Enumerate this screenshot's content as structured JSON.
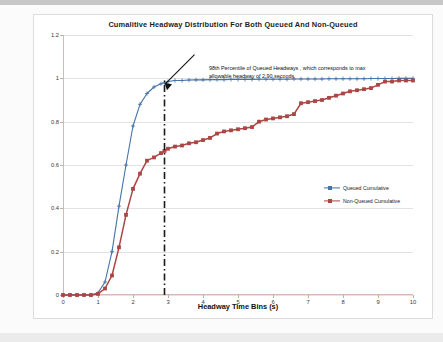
{
  "chart_data": {
    "type": "line",
    "title": "Cumalitive Headway Distribution For Both Queued And Non-Queued",
    "xlabel": "Headway Time Bins (s)",
    "ylabel": "Cumalitive Proportion",
    "xlim": [
      0,
      10
    ],
    "ylim": [
      0,
      1.2
    ],
    "xticks": [
      "0",
      "1",
      "2",
      "3",
      "4",
      "5",
      "6",
      "7",
      "8",
      "9",
      "10"
    ],
    "yticks": [
      "0",
      "0.2",
      "0.4",
      "0.6",
      "0.8",
      "1",
      "1.2"
    ],
    "grid": "horizontal",
    "legend_position": "right-middle",
    "annotations": [
      {
        "name": "percentile-callout",
        "text": "98th Percentile of Queued Headways , which corresponds to max allowable headway of 2.90 seconds",
        "target_x": 2.9,
        "target_y": 0.98
      },
      {
        "name": "threshold-line",
        "style": "dash-dot vertical",
        "x": 2.9,
        "color": "#1a1a1a"
      }
    ],
    "series": [
      {
        "name": "Queued Cumulative",
        "color": "#4572a7",
        "marker": "plus",
        "x": [
          0,
          0.2,
          0.4,
          0.6,
          0.8,
          1.0,
          1.2,
          1.4,
          1.6,
          1.8,
          2.0,
          2.2,
          2.4,
          2.6,
          2.8,
          2.9,
          3.0,
          3.2,
          3.4,
          3.6,
          3.8,
          4.0,
          4.2,
          4.4,
          4.6,
          4.8,
          5.0,
          5.2,
          5.4,
          5.6,
          5.8,
          6.0,
          6.2,
          6.4,
          6.6,
          6.8,
          7.0,
          7.2,
          7.4,
          7.6,
          7.8,
          8.0,
          8.2,
          8.4,
          8.6,
          8.8,
          9.0,
          9.2,
          9.4,
          9.6,
          9.8,
          10.0
        ],
        "y": [
          0,
          0,
          0,
          0,
          0,
          0.01,
          0.06,
          0.2,
          0.41,
          0.6,
          0.78,
          0.88,
          0.93,
          0.96,
          0.975,
          0.98,
          0.985,
          0.99,
          0.99,
          0.992,
          0.993,
          0.993,
          0.994,
          0.994,
          0.994,
          0.995,
          0.995,
          0.995,
          0.995,
          0.996,
          0.996,
          0.996,
          0.996,
          0.996,
          0.997,
          0.997,
          0.997,
          0.997,
          0.997,
          0.998,
          0.998,
          0.998,
          0.998,
          0.998,
          0.998,
          0.999,
          0.999,
          0.999,
          0.999,
          1.0,
          1.0,
          1.0
        ]
      },
      {
        "name": "Non-Queued Cumulative",
        "color": "#aa4643",
        "marker": "square",
        "x": [
          0,
          0.2,
          0.4,
          0.6,
          0.8,
          1.0,
          1.2,
          1.4,
          1.6,
          1.8,
          2.0,
          2.2,
          2.4,
          2.6,
          2.8,
          2.9,
          3.0,
          3.2,
          3.4,
          3.6,
          3.8,
          4.0,
          4.2,
          4.4,
          4.6,
          4.8,
          5.0,
          5.2,
          5.4,
          5.6,
          5.8,
          6.0,
          6.2,
          6.4,
          6.6,
          6.8,
          7.0,
          7.2,
          7.4,
          7.6,
          7.8,
          8.0,
          8.2,
          8.4,
          8.6,
          8.8,
          9.0,
          9.2,
          9.4,
          9.6,
          9.8,
          10.0
        ],
        "y": [
          0,
          0,
          0,
          0,
          0,
          0.005,
          0.03,
          0.09,
          0.22,
          0.37,
          0.49,
          0.56,
          0.62,
          0.635,
          0.655,
          0.665,
          0.675,
          0.685,
          0.69,
          0.7,
          0.705,
          0.715,
          0.725,
          0.745,
          0.755,
          0.76,
          0.765,
          0.77,
          0.775,
          0.8,
          0.81,
          0.815,
          0.82,
          0.825,
          0.835,
          0.885,
          0.89,
          0.895,
          0.9,
          0.91,
          0.92,
          0.93,
          0.94,
          0.945,
          0.95,
          0.955,
          0.97,
          0.985,
          0.985,
          0.99,
          0.99,
          0.99
        ]
      }
    ]
  }
}
